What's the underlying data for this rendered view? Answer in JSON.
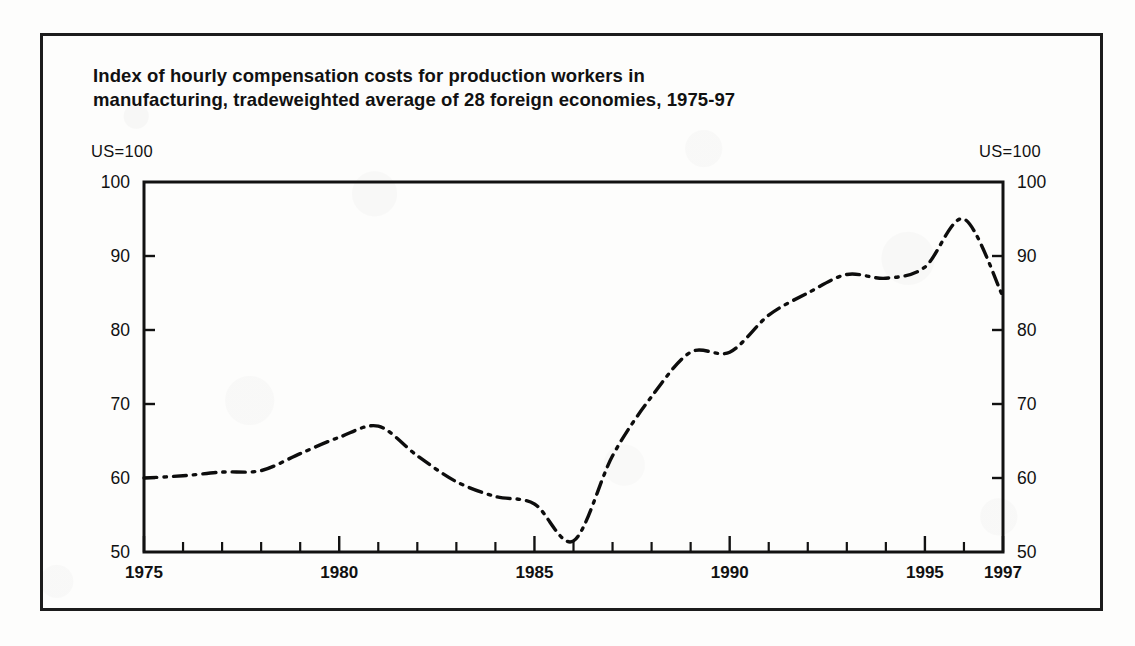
{
  "figure": {
    "title_line1": "Index of hourly compensation costs for production workers in",
    "title_line2": "manufacturing, tradeweighted average of 28 foreign economies, 1975-97",
    "unit_label_left": "US=100",
    "unit_label_right": "US=100",
    "frame_color": "#1c1c1c",
    "line_color": "#0d0d0d",
    "background_color": "#fdfdfc"
  },
  "chart_data": {
    "type": "line",
    "title": "Index of hourly compensation costs for production workers in manufacturing, tradeweighted average of 28 foreign economies, 1975-97",
    "xlabel": "",
    "ylabel": "US=100",
    "x": [
      1975,
      1976,
      1977,
      1978,
      1979,
      1980,
      1981,
      1982,
      1983,
      1984,
      1985,
      1986,
      1987,
      1988,
      1989,
      1990,
      1991,
      1992,
      1993,
      1994,
      1995,
      1996,
      1997
    ],
    "values": [
      60.0,
      60.3,
      60.8,
      61.0,
      63.3,
      65.5,
      67.0,
      63.0,
      59.5,
      57.5,
      56.5,
      51.5,
      63.0,
      71.0,
      77.0,
      77.0,
      82.0,
      85.0,
      87.5,
      87.0,
      88.5,
      95.0,
      84.5
    ],
    "series": [
      {
        "name": "Tradeweighted index of 28 foreign economies",
        "values": [
          60.0,
          60.3,
          60.8,
          61.0,
          63.3,
          65.5,
          67.0,
          63.0,
          59.5,
          57.5,
          56.5,
          51.5,
          63.0,
          71.0,
          77.0,
          77.0,
          82.0,
          85.0,
          87.5,
          87.0,
          88.5,
          95.0,
          84.5
        ]
      }
    ],
    "xlim": [
      1975,
      1997
    ],
    "ylim": [
      50,
      100
    ],
    "x_tick_labels": [
      "1975",
      "1980",
      "1985",
      "1990",
      "1995",
      "1997"
    ],
    "x_tick_values": [
      1975,
      1980,
      1985,
      1990,
      1995,
      1997
    ],
    "x_minor_ticks_every": 1,
    "y_tick_labels_left": [
      "100",
      "90",
      "80",
      "70",
      "60",
      "50"
    ],
    "y_tick_labels_right": [
      "100",
      "90",
      "80",
      "70",
      "60",
      "50"
    ],
    "y_tick_values": [
      100,
      90,
      80,
      70,
      60,
      50
    ],
    "grid": false,
    "legend": false,
    "line_style": "dash-dot",
    "axes_style": "box-left-right-bottom-top"
  },
  "y_ticks": [
    {
      "label": "100",
      "value": 100
    },
    {
      "label": "90",
      "value": 90
    },
    {
      "label": "80",
      "value": 80
    },
    {
      "label": "70",
      "value": 70
    },
    {
      "label": "60",
      "value": 60
    },
    {
      "label": "50",
      "value": 50
    }
  ],
  "x_ticks": [
    {
      "label": "1975",
      "value": 1975
    },
    {
      "label": "1980",
      "value": 1980
    },
    {
      "label": "1985",
      "value": 1985
    },
    {
      "label": "1990",
      "value": 1990
    },
    {
      "label": "1995",
      "value": 1995
    },
    {
      "label": "1997",
      "value": 1997
    }
  ]
}
